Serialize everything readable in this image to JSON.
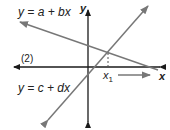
{
  "diagram": {
    "equation1": "y = a + bx",
    "equation2": "y = c + dx",
    "label_panel": "(2)",
    "axis_x": "x",
    "axis_y": "y",
    "point_x": "x",
    "point_sub": "1",
    "colors": {
      "axis": "#1a1a1a",
      "line": "#777777",
      "text": "#222222"
    }
  }
}
